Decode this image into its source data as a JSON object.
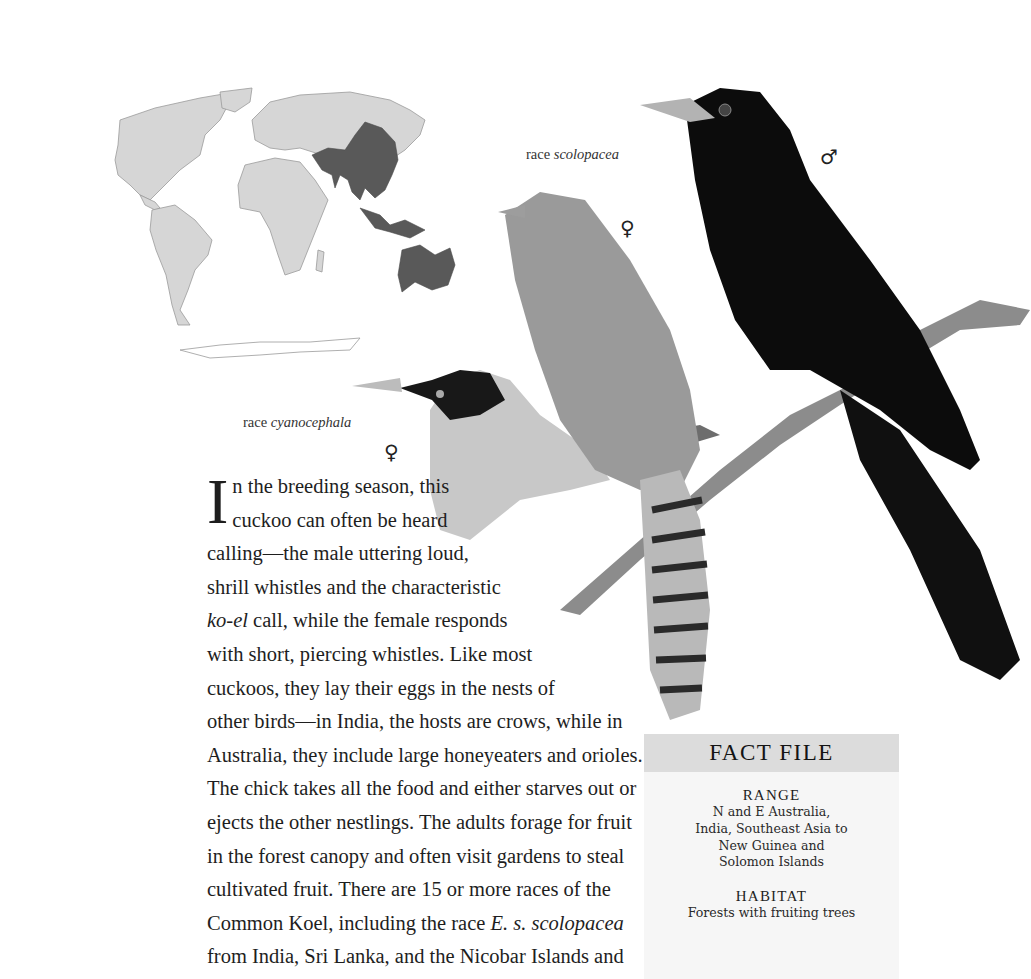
{
  "map": {
    "description": "World range map with highlighted distribution in South Asia, Southeast Asia, New Guinea and Australia",
    "colors": {
      "land": "#d6d6d6",
      "range": "#595959",
      "outline": "#9a9a9a"
    }
  },
  "illustration": {
    "birds": [
      {
        "label_prefix": "race",
        "label_race": "scolopacea",
        "sex": "♀",
        "plumage": "brown barred/spotted"
      },
      {
        "label_prefix": "",
        "label_race": "",
        "sex": "♂",
        "plumage": "glossy black"
      },
      {
        "label_prefix": "race",
        "label_race": "cyanocephala",
        "sex": "♀",
        "plumage": "black head, spotted"
      }
    ]
  },
  "captions": {
    "scolopacea": {
      "prefix": "race ",
      "race": "scolopacea"
    },
    "cyanocephala": {
      "prefix": "race ",
      "race": "cyanocephala"
    },
    "female_symbol": "♀",
    "male_symbol": "♂"
  },
  "article": {
    "dropcap": "I",
    "lines": [
      "n the breeding season, this",
      "cuckoo can often be heard",
      "calling—the male uttering loud,",
      "shrill whistles and the characteristic",
      [
        "",
        "ko-el",
        " call, while the female responds"
      ],
      "with short, piercing whistles. Like most",
      "cuckoos, they lay their eggs in the nests of",
      "other birds—in India, the hosts are crows, while in",
      "Australia, they include large honeyeaters and orioles.",
      "The chick takes all the food and either starves out or",
      "ejects the other nestlings. The adults forage for fruit",
      "in the forest canopy and often visit gardens to steal",
      "cultivated fruit. There are 15 or more races of the",
      [
        "Common Koel, including the race ",
        "E. s. scolopacea",
        ""
      ],
      "from India, Sri Lanka, and the Nicobar Islands and"
    ],
    "line5_pre": "",
    "line5_italic": "ko-el",
    "line5_post": " call, while the female responds",
    "line14_pre": "Common Koel, including the race ",
    "line14_italic": "E. s. scolopacea"
  },
  "fact_file": {
    "title": "FACT FILE",
    "sections": [
      {
        "heading": "RANGE",
        "lines": [
          "N and E Australia,",
          "India, Southeast Asia to",
          "New Guinea and",
          "Solomon Islands"
        ]
      },
      {
        "heading": "HABITAT",
        "lines": [
          "Forests with fruiting trees"
        ]
      }
    ]
  }
}
